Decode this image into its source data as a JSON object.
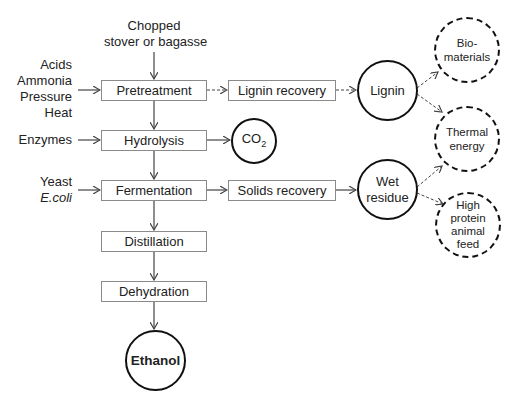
{
  "feedstock": {
    "line1": "Chopped",
    "line2": "stover or bagasse"
  },
  "inputs": {
    "pretreatment": [
      "Acids",
      "Ammonia",
      "Pressure",
      "Heat"
    ],
    "hydrolysis": [
      "Enzymes"
    ],
    "fermentation": [
      "Yeast",
      "E.coli"
    ]
  },
  "process_steps": [
    "Pretreatment",
    "Hydrolysis",
    "Fermentation",
    "Distillation",
    "Dehydration"
  ],
  "recovery_steps": {
    "lignin": "Lignin recovery",
    "solids": "Solids recovery"
  },
  "intermediates": {
    "lignin": "Lignin",
    "wet_residue": [
      "Wet",
      "residue"
    ],
    "co2": {
      "base": "CO",
      "sub": "2"
    }
  },
  "product": "Ethanol",
  "coproducts": {
    "biomaterials": [
      "Bio-",
      "materials"
    ],
    "thermal_energy": [
      "Thermal",
      "energy"
    ],
    "animal_feed": [
      "High",
      "protein",
      "animal",
      "feed"
    ]
  },
  "colors": {
    "box_border": "#8a8a8a",
    "circle_border": "#111111",
    "arrow": "#444444",
    "text": "#222222"
  }
}
